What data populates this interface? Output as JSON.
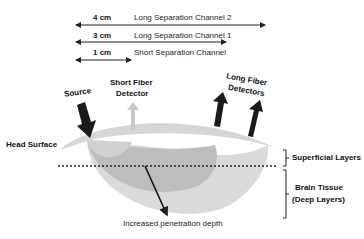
{
  "channels": [
    {
      "distance": "4 cm",
      "label": "Long Separation Channel 2"
    },
    {
      "distance": "3 cm",
      "label": "Long Separation Channel 1"
    },
    {
      "distance": "1 cm",
      "label": "Short Separation Channel"
    }
  ],
  "labels": {
    "source": "Source",
    "short_detector_line1": "Short Fiber",
    "short_detector_line2": "Detector",
    "long_detectors_line1": "Long Fiber",
    "long_detectors_line2": "Detectors",
    "head_surface": "Head Surface",
    "superficial": "Superficial Layers",
    "brain_line1": "Brain Tissue",
    "brain_line2": "(Deep Layers)",
    "depth": "Increased penetration depth"
  },
  "colors": {
    "arrow_dark": "#1a1a1a",
    "arrow_light": "#c8c8c8",
    "tissue_light": "#d9d9d9",
    "tissue_mid": "#c4c4c4",
    "tissue_dark": "#b5b5b5"
  }
}
